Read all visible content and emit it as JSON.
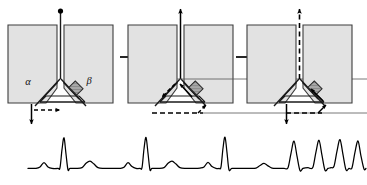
{
  "figure": {
    "panel_count": 3,
    "colors": {
      "atrium_fill": "#e2e2e2",
      "atrium_stroke": "#3c3c3c",
      "pathway_stroke": "#1a1a1a",
      "block_fill": "#a8a8a8",
      "block_stroke": "#2a2a2a",
      "arrow_color": "#000000",
      "trace_color": "#000000",
      "background": "#ffffff"
    }
  },
  "panels": [
    {
      "id": "panel-1",
      "name": "panel-sinus-beat",
      "labels": {
        "slow_pathway": "α",
        "fast_pathway": "β"
      },
      "top_arrow_style": "solid-dot",
      "top_arrow_direction": "up",
      "bottom_arrow_direction": "down",
      "bottom_arrow_style": "solid",
      "lateral_arrow_style": "dashed",
      "lateral_arrow_direction": "right",
      "block_present": true,
      "block_location": "fast-pathway"
    },
    {
      "id": "panel-2",
      "name": "panel-echo-beat",
      "labels": {
        "slow_pathway": "",
        "fast_pathway": ""
      },
      "top_arrow_style": "solid",
      "top_arrow_direction": "up",
      "bottom_arrow_direction": "right",
      "bottom_arrow_style": "dashed",
      "lateral_arrow_style": "solid",
      "lateral_arrow_direction": "left",
      "block_present": true,
      "block_location": "fast-pathway"
    },
    {
      "id": "panel-3",
      "name": "panel-reentrant-tachycardia",
      "labels": {
        "slow_pathway": "",
        "fast_pathway": ""
      },
      "top_arrow_style": "dashed",
      "top_arrow_direction": "up",
      "bottom_arrow_direction": "down",
      "bottom_arrow_style": "solid",
      "lateral_arrow_style": "dashed",
      "lateral_arrow_direction": "right",
      "block_present": true,
      "block_location": "fast-pathway"
    }
  ],
  "transition_arrows": [
    {
      "name": "transition-arrow-1-to-2",
      "direction": "right",
      "style": "solid"
    },
    {
      "name": "transition-arrow-2-to-3",
      "direction": "right",
      "style": "solid"
    }
  ],
  "chart_data": {
    "type": "line",
    "title": "",
    "xlabel": "",
    "ylabel": "",
    "grid": false,
    "legend": null,
    "xlim": [
      0,
      367
    ],
    "ylim": [
      0,
      1
    ],
    "series": [
      {
        "name": "rhythm-strip",
        "description": "Surface ECG rhythm strip: sinus beats, then a premature beat initiating reentrant tachycardia",
        "points": [
          [
            28,
            0.1
          ],
          [
            36,
            0.1
          ],
          [
            40,
            0.14
          ],
          [
            44,
            0.26
          ],
          [
            48,
            0.14
          ],
          [
            52,
            0.1
          ],
          [
            58,
            0.1
          ],
          [
            60,
            0.12
          ],
          [
            62,
            0.62
          ],
          [
            64,
            0.95
          ],
          [
            66,
            0.5
          ],
          [
            68,
            0.06
          ],
          [
            70,
            0.1
          ],
          [
            76,
            0.1
          ],
          [
            82,
            0.12
          ],
          [
            86,
            0.24
          ],
          [
            90,
            0.3
          ],
          [
            94,
            0.22
          ],
          [
            98,
            0.12
          ],
          [
            104,
            0.1
          ],
          [
            112,
            0.1
          ],
          [
            120,
            0.1
          ],
          [
            124,
            0.13
          ],
          [
            128,
            0.26
          ],
          [
            132,
            0.15
          ],
          [
            136,
            0.1
          ],
          [
            140,
            0.1
          ],
          [
            142,
            0.12
          ],
          [
            144,
            0.64
          ],
          [
            146,
            0.96
          ],
          [
            148,
            0.52
          ],
          [
            150,
            0.06
          ],
          [
            152,
            0.1
          ],
          [
            158,
            0.1
          ],
          [
            164,
            0.12
          ],
          [
            168,
            0.24
          ],
          [
            172,
            0.3
          ],
          [
            176,
            0.22
          ],
          [
            180,
            0.12
          ],
          [
            186,
            0.1
          ],
          [
            194,
            0.1
          ],
          [
            200,
            0.11
          ],
          [
            204,
            0.14
          ],
          [
            208,
            0.27
          ],
          [
            212,
            0.15
          ],
          [
            216,
            0.1
          ],
          [
            219,
            0.1
          ],
          [
            221,
            0.14
          ],
          [
            223,
            0.66
          ],
          [
            225,
            0.97
          ],
          [
            227,
            0.54
          ],
          [
            229,
            0.06
          ],
          [
            232,
            0.1
          ],
          [
            240,
            0.1
          ],
          [
            250,
            0.1
          ],
          [
            256,
            0.11
          ],
          [
            260,
            0.18
          ],
          [
            264,
            0.24
          ],
          [
            268,
            0.17
          ],
          [
            272,
            0.11
          ],
          [
            278,
            0.1
          ],
          [
            284,
            0.1
          ],
          [
            288,
            0.12
          ],
          [
            291,
            0.52
          ],
          [
            294,
            0.86
          ],
          [
            297,
            0.44
          ],
          [
            300,
            0.04
          ],
          [
            303,
            0.1
          ],
          [
            308,
            0.12
          ],
          [
            310,
            0.1
          ],
          [
            313,
            0.14
          ],
          [
            316,
            0.56
          ],
          [
            319,
            0.88
          ],
          [
            322,
            0.46
          ],
          [
            325,
            0.05
          ],
          [
            328,
            0.1
          ],
          [
            331,
            0.12
          ],
          [
            334,
            0.16
          ],
          [
            337,
            0.58
          ],
          [
            340,
            0.9
          ],
          [
            343,
            0.48
          ],
          [
            346,
            0.06
          ],
          [
            349,
            0.1
          ],
          [
            352,
            0.12
          ],
          [
            355,
            0.55
          ],
          [
            358,
            0.86
          ],
          [
            361,
            0.44
          ],
          [
            364,
            0.08
          ],
          [
            366,
            0.1
          ]
        ]
      }
    ],
    "annotations": [
      {
        "name": "sinus-beats",
        "text": "",
        "x_range": [
          28,
          250
        ]
      },
      {
        "name": "tachycardia-run",
        "text": "",
        "x_range": [
          284,
          367
        ]
      }
    ]
  }
}
